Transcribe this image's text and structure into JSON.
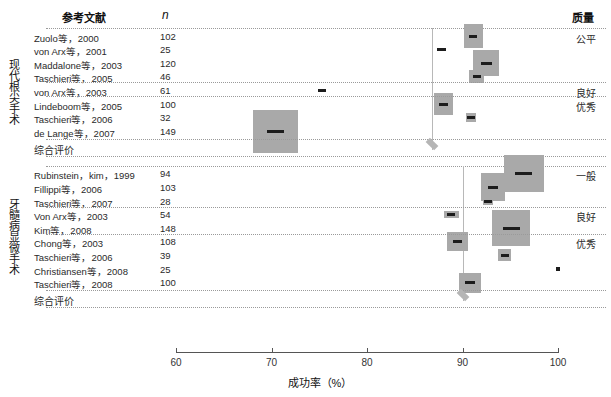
{
  "chart_data": {
    "type": "table",
    "title": "",
    "xlabel": "成功率（%）",
    "ylabel": "",
    "xlim": [
      60,
      100
    ],
    "xticks": [
      60,
      70,
      80,
      90,
      100
    ],
    "xticklabels": [
      "60",
      "70",
      "80",
      "90",
      "100"
    ],
    "grid": false,
    "legend": "none",
    "columns": [
      "参考文献",
      "n",
      "成功率（%）",
      "质量"
    ],
    "groups": [
      {
        "label": "现代根尖手术",
        "pooled_estimate": 86.8,
        "rows": [
          {
            "study": "Zuolo等，2000",
            "n": "102",
            "value": 91.1,
            "box_w": 19,
            "box_h": 24,
            "quality": "公平"
          },
          {
            "study": "von Arx等，2001",
            "n": "25",
            "value": 87.8,
            "box_w": 18,
            "box_h": 5,
            "quality": ""
          },
          {
            "study": "Maddalone等，2003",
            "n": "120",
            "value": 92.5,
            "box_w": 26,
            "box_h": 26,
            "quality": ""
          },
          {
            "study": "Taschieri等，2005",
            "n": "46",
            "value": 91.5,
            "box_w": 15,
            "box_h": 13,
            "quality": ""
          },
          {
            "study": "von Arx等，2003",
            "n": "61",
            "value": 75.3,
            "box_w": 17,
            "box_h": 6,
            "quality": "良好"
          },
          {
            "study": "Lindeboom等，2005",
            "n": "100",
            "value": 88.0,
            "box_w": 19,
            "box_h": 22,
            "quality": "优秀"
          },
          {
            "study": "Taschieri等，2006",
            "n": "32",
            "value": 90.9,
            "box_w": 10,
            "box_h": 9,
            "quality": ""
          },
          {
            "study": "de Lange等，2007",
            "n": "149",
            "value": 70.4,
            "box_w": 45,
            "box_h": 43,
            "quality": ""
          }
        ],
        "summary_label": "综合评价"
      },
      {
        "label": "牙髓病显微手术",
        "pooled_estimate": 90.0,
        "rows": [
          {
            "study": "Rubinstein，kim，1999",
            "n": "94",
            "value": 96.4,
            "box_w": 40,
            "box_h": 37,
            "quality": "一般"
          },
          {
            "study": "Fillippi等，2006",
            "n": "103",
            "value": 93.2,
            "box_w": 24,
            "box_h": 28,
            "quality": ""
          },
          {
            "study": "Taschieri等，2007",
            "n": "28",
            "value": 92.7,
            "box_w": 10,
            "box_h": 8,
            "quality": ""
          },
          {
            "study": "Von Arx等，2003",
            "n": "54",
            "value": 88.8,
            "box_w": 15,
            "box_h": 7,
            "quality": "良好"
          },
          {
            "study": "Kim等，2008",
            "n": "148",
            "value": 95.1,
            "box_w": 38,
            "box_h": 36,
            "quality": ""
          },
          {
            "study": "Chong等，2003",
            "n": "108",
            "value": 89.5,
            "box_w": 21,
            "box_h": 19,
            "quality": "优秀"
          },
          {
            "study": "Taschieri等，2006",
            "n": "39",
            "value": 94.4,
            "box_w": 13,
            "box_h": 12,
            "quality": ""
          },
          {
            "study": "Christiansen等，2008",
            "n": "25",
            "value": 100.0,
            "box_w": 5,
            "box_h": 5,
            "quality": ""
          },
          {
            "study": "Taschieri等，2008",
            "n": "100",
            "value": 90.8,
            "box_w": 22,
            "box_h": 20,
            "quality": ""
          }
        ],
        "summary_label": "综合评价"
      }
    ]
  },
  "header": {
    "reference": "参考文献",
    "n": "n",
    "quality": "质量"
  },
  "axis": {
    "title": "成功率（%）",
    "ticks": [
      "60",
      "70",
      "80",
      "90",
      "100"
    ]
  },
  "colors": {
    "box": "#a9a9a9",
    "marker": "#1c1c1c",
    "diamond": "#b5b5b5",
    "rule": "#9a9a9a",
    "vline": "#b8b8b8",
    "axis": "#555555"
  }
}
